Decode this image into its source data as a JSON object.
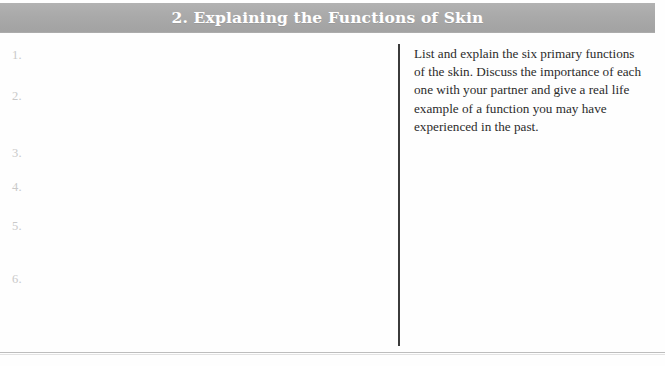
{
  "page": {
    "background_color": "#fefefe",
    "divider_color": "#3b3b3b",
    "rule_color": "#bdbdbd"
  },
  "header": {
    "title": "2. Explaining the Functions of Skin",
    "background_color": "#a9a9a9",
    "text_color": "#ffffff"
  },
  "answers": {
    "number_color": "#c9c9c9",
    "items": [
      {
        "label": "1."
      },
      {
        "label": "2."
      },
      {
        "label": "3."
      },
      {
        "label": "4."
      },
      {
        "label": "5."
      },
      {
        "label": "6."
      }
    ]
  },
  "instructions": {
    "text": "List and explain the six primary functions of the skin. Discuss the importance of each one with your partner and give a real life example of a function you may have experienced in the past.",
    "text_color": "#2b2b2b"
  }
}
